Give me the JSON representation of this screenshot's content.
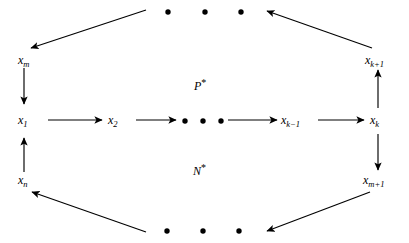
{
  "diagram": {
    "type": "directed-cycle-graph",
    "title": "",
    "background_color": "#ffffff",
    "stroke_color": "#000000",
    "width": 409,
    "height": 243,
    "nodes": [
      {
        "id": "x1",
        "base": "x",
        "subscript": "1",
        "label": "x1",
        "x": 22,
        "y": 122
      },
      {
        "id": "x2",
        "base": "x",
        "subscript": "2",
        "label": "x2",
        "x": 113,
        "y": 122
      },
      {
        "id": "xk-1",
        "base": "x",
        "subscript": "k−1",
        "label": "xk−1",
        "x": 286,
        "y": 122
      },
      {
        "id": "xk",
        "base": "x",
        "subscript": "k",
        "label": "xk",
        "x": 374,
        "y": 122
      },
      {
        "id": "xm",
        "base": "x",
        "subscript": "m",
        "label": "xm",
        "x": 22,
        "y": 60
      },
      {
        "id": "xk+1",
        "base": "x",
        "subscript": "k+1",
        "label": "xk+1",
        "x": 372,
        "y": 60
      },
      {
        "id": "xn",
        "base": "x",
        "subscript": "n",
        "label": "xn",
        "x": 22,
        "y": 180
      },
      {
        "id": "xm+1",
        "base": "x",
        "subscript": "m+1",
        "label": "xm+1",
        "x": 370,
        "y": 180
      }
    ],
    "regions": [
      {
        "id": "p-star",
        "base": "P",
        "star": "*",
        "label": "P*",
        "x": 198,
        "y": 84,
        "position": "upper-center"
      },
      {
        "id": "n-star",
        "base": "N",
        "star": "*",
        "label": "N*",
        "x": 197,
        "y": 169,
        "position": "lower-center"
      }
    ],
    "ellipses": [
      {
        "id": "top-ellipsis",
        "dot_count": 3,
        "orientation": "horizontal",
        "x": 200,
        "y": 12,
        "spacing": 35
      },
      {
        "id": "middle-ellipsis",
        "dot_count": 3,
        "orientation": "horizontal",
        "x": 200,
        "y": 122,
        "spacing": 35
      },
      {
        "id": "bottom-ellipsis",
        "dot_count": 3,
        "orientation": "horizontal",
        "x": 200,
        "y": 230,
        "spacing": 35
      }
    ],
    "edges": [
      {
        "id": "edge-x1-x2",
        "from": "x1",
        "to": "x2",
        "direction": "right",
        "style": "straight"
      },
      {
        "id": "edge-x2-dots",
        "from": "x2",
        "to": "middle-ellipsis",
        "direction": "right",
        "style": "straight"
      },
      {
        "id": "edge-dots-xk-1",
        "from": "middle-ellipsis",
        "to": "xk-1",
        "direction": "right",
        "style": "straight"
      },
      {
        "id": "edge-xk-1-xk",
        "from": "xk-1",
        "to": "xk",
        "direction": "right",
        "style": "straight"
      },
      {
        "id": "edge-xk-xk+1",
        "from": "xk",
        "to": "xk+1",
        "direction": "up",
        "style": "straight"
      },
      {
        "id": "edge-xk+1-topdots",
        "from": "xk+1",
        "to": "top-ellipsis",
        "direction": "up-left",
        "style": "diagonal"
      },
      {
        "id": "edge-topdots-xm",
        "from": "top-ellipsis",
        "to": "xm",
        "direction": "down-left",
        "style": "diagonal"
      },
      {
        "id": "edge-xm-x1",
        "from": "xm",
        "to": "x1",
        "direction": "down",
        "style": "straight"
      },
      {
        "id": "edge-xk-xm+1",
        "from": "xk",
        "to": "xm+1",
        "direction": "down",
        "style": "straight"
      },
      {
        "id": "edge-xm+1-botdots",
        "from": "xm+1",
        "to": "bottom-ellipsis",
        "direction": "down-left",
        "style": "diagonal"
      },
      {
        "id": "edge-botdots-xn",
        "from": "bottom-ellipsis",
        "to": "xn",
        "direction": "up-left",
        "style": "diagonal"
      },
      {
        "id": "edge-xn-x1",
        "from": "xn",
        "to": "x1",
        "direction": "up",
        "style": "straight"
      }
    ]
  }
}
